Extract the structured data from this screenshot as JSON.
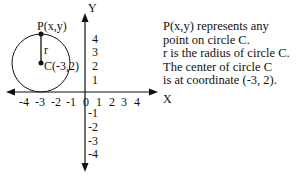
{
  "diagram": {
    "type": "coordinate-plane-circle",
    "axes": {
      "x_label": "X",
      "y_label": "Y",
      "x_ticks": [
        "-4",
        "-3",
        "-2",
        "-1",
        "0",
        "1",
        "2",
        "3",
        "4"
      ],
      "y_ticks_pos": [
        "4",
        "3",
        "2",
        "1"
      ],
      "y_ticks_neg": [
        "-1",
        "-2",
        "-3",
        "-4"
      ]
    },
    "circle": {
      "center_label": "C(-3,2)",
      "point_label": "P(x,y)",
      "radius_label": "r",
      "center": [
        -3,
        2
      ],
      "radius": 2
    }
  },
  "description": {
    "lines": [
      "P(x,y) represents any",
      "point on circle C.",
      "r is the radius of circle C.",
      "The center of circle C",
      "is at coordinate (-3, 2)."
    ]
  }
}
